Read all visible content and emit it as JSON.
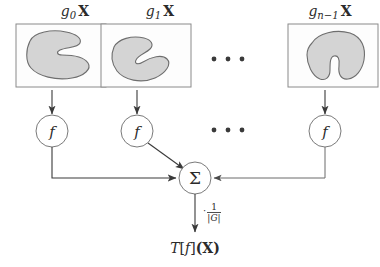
{
  "figure": {
    "type": "flow-diagram",
    "background_color": "#ffffff",
    "stroke_color": "#3a3a3a",
    "blob_fill_color": "#d4d4d4",
    "blob_stroke_color": "#6e6e6e",
    "panel_stroke_color": "#8a8a8a"
  },
  "branches": [
    {
      "id": "branch-0",
      "input_label": {
        "operator": "g",
        "subscript": "0",
        "operand": "X"
      },
      "input_label_text": "g0 X",
      "node_label": "f",
      "panel_center_x": 75,
      "node_center_x": 52
    },
    {
      "id": "branch-1",
      "input_label": {
        "operator": "g",
        "subscript": "1",
        "operand": "X"
      },
      "input_label_text": "g1 X",
      "node_label": "f",
      "panel_center_x": 160,
      "node_center_x": 137
    },
    {
      "id": "branch-n-1",
      "input_label": {
        "operator": "g",
        "subscript": "n−1",
        "operand": "X"
      },
      "input_label_text": "gn−1 X",
      "node_label": "f",
      "panel_center_x": 330,
      "node_center_x": 325
    }
  ],
  "ellipses": [
    {
      "id": "ellipsis-panels",
      "text": "· · ·",
      "dot_count": 3,
      "center_x": 228,
      "center_y": 59
    },
    {
      "id": "ellipsis-nodes",
      "text": "· · ·",
      "dot_count": 3,
      "center_x": 228,
      "center_y": 130
    }
  ],
  "sum_node": {
    "label": "Σ",
    "center_x": 195,
    "center_y": 178,
    "radius": 16
  },
  "scale_factor": {
    "prefix": "·",
    "numerator": "1",
    "denominator": "|G|",
    "full_text": "· 1/|G|"
  },
  "output": {
    "label_parts": {
      "transform": "T",
      "bracket_open": "[",
      "function": "f",
      "bracket_close": "]",
      "argument": "(X)"
    },
    "label_text": "T[f](X)"
  }
}
